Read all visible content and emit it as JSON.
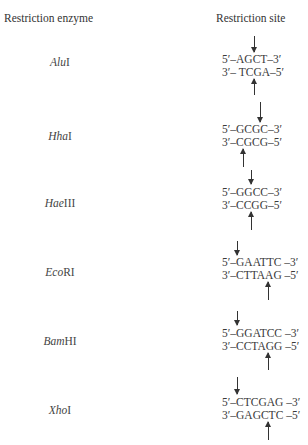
{
  "headers": {
    "enzyme": "Restriction enzyme",
    "site": "Restriction site"
  },
  "enzymes": [
    {
      "italic": "Alu",
      "suffix": "I",
      "top": "5′–AGCT–3′",
      "bottom": "3′– TCGA–5′",
      "cut_top_x": 254,
      "cut_bottom_x": 254
    },
    {
      "italic": "Hha",
      "suffix": "I",
      "top": "5′–GCGC–3′",
      "bottom": "3′–CGCG–5′",
      "cut_top_x": 260,
      "cut_bottom_x": 243
    },
    {
      "italic": "Hae",
      "suffix": "III",
      "top": "5′–GGCC–3′",
      "bottom": "3′–CCGG–5′",
      "cut_top_x": 251,
      "cut_bottom_x": 251
    },
    {
      "italic": "Eco",
      "suffix": "RI",
      "top": "5′–GAATTC –3′",
      "bottom": "3′–CTTAAG –5′",
      "cut_top_x": 237,
      "cut_bottom_x": 268
    },
    {
      "italic": "Bam",
      "suffix": "HI",
      "top": "5′–GGATCC –3′",
      "bottom": "3′–CCTAGG –5′",
      "cut_top_x": 237,
      "cut_bottom_x": 268
    },
    {
      "italic": "Xho",
      "suffix": "I",
      "top": "5′–CTCGAG –3′",
      "bottom": "3′–GAGCTC –5′",
      "cut_top_x": 237,
      "cut_bottom_x": 268
    }
  ]
}
